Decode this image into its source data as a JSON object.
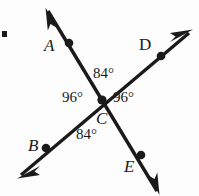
{
  "figure": {
    "background_color": "#fdfdfd",
    "ink_color": "#1a1a1a",
    "width": 199,
    "height": 196
  },
  "points": [
    {
      "id": "A",
      "label": "A",
      "style": "italic",
      "x": 69,
      "y": 43,
      "label_x": 44,
      "label_y": 37
    },
    {
      "id": "B",
      "label": "B",
      "style": "italic",
      "x": 46,
      "y": 148,
      "label_x": 28,
      "label_y": 137
    },
    {
      "id": "C",
      "label": "C",
      "style": "italic",
      "x": 102,
      "y": 100,
      "label_x": 96,
      "label_y": 110
    },
    {
      "id": "D",
      "label": "D",
      "style": "upright",
      "x": 161,
      "y": 56,
      "label_x": 139,
      "label_y": 36
    },
    {
      "id": "E",
      "label": "E",
      "style": "italic",
      "x": 141,
      "y": 155,
      "label_x": 124,
      "label_y": 158
    }
  ],
  "lines": [
    {
      "id": "line-AE",
      "through": [
        "A",
        "C",
        "E"
      ],
      "start": {
        "x": 48,
        "y": 11
      },
      "end": {
        "x": 157,
        "y": 191
      },
      "arrow_start": true,
      "arrow_end": true
    },
    {
      "id": "line-BD",
      "through": [
        "B",
        "C",
        "D"
      ],
      "start": {
        "x": 21,
        "y": 175
      },
      "end": {
        "x": 189,
        "y": 33
      },
      "arrow_start": true,
      "arrow_end": true
    }
  ],
  "angles": [
    {
      "id": "angle-top",
      "label": "84°",
      "value": 84,
      "position": "top",
      "between": [
        "A",
        "D"
      ]
    },
    {
      "id": "angle-left",
      "label": "96°",
      "value": 96,
      "position": "left",
      "between": [
        "A",
        "B"
      ]
    },
    {
      "id": "angle-right",
      "label": "96°",
      "value": 96,
      "position": "right",
      "between": [
        "D",
        "E"
      ]
    },
    {
      "id": "angle-bottom",
      "label": "84°",
      "value": 84,
      "position": "bottom",
      "between": [
        "B",
        "E"
      ]
    }
  ],
  "artifacts": [
    {
      "id": "edge-mark",
      "description": "small black square at left edge",
      "x": 2,
      "y": 31
    }
  ]
}
